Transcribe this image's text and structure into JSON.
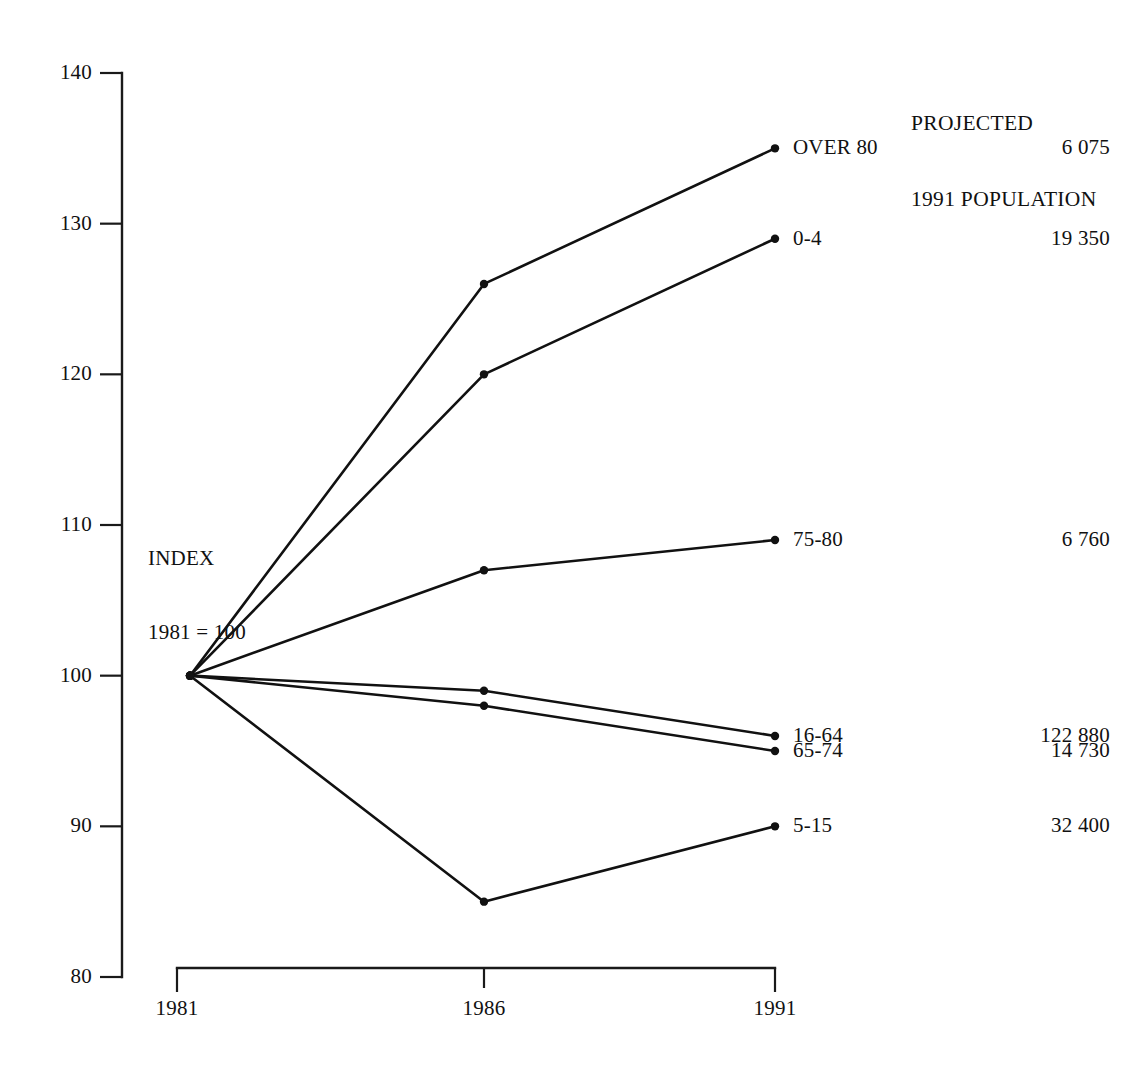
{
  "chart_data": {
    "type": "line",
    "title": "",
    "xlabel": "",
    "ylabel": "",
    "x": [
      1981,
      1986,
      1991
    ],
    "xtick_labels": [
      "1981",
      "1986",
      "1991"
    ],
    "ytick_labels": [
      "140",
      "130",
      "120",
      "110",
      "100",
      "90",
      "80"
    ],
    "yticks": [
      140,
      130,
      120,
      110,
      100,
      90,
      80
    ],
    "ylim": [
      80,
      140
    ],
    "grid": false,
    "legend_position": "right-of-endpoints",
    "annotations": {
      "index_note_line1": "INDEX",
      "index_note_line2": "1981 = 100",
      "column_header_line1": "PROJECTED",
      "column_header_line2": "1991 POPULATION"
    },
    "series": [
      {
        "name": "OVER 80",
        "values": [
          100,
          126,
          135
        ],
        "projected_1991_population": "6 075"
      },
      {
        "name": "0-4",
        "values": [
          100,
          120,
          129
        ],
        "projected_1991_population": "19 350"
      },
      {
        "name": "75-80",
        "values": [
          100,
          107,
          109
        ],
        "projected_1991_population": "6 760"
      },
      {
        "name": "16-64",
        "values": [
          100,
          99,
          96
        ],
        "projected_1991_population": "122 880"
      },
      {
        "name": "65-74",
        "values": [
          100,
          98,
          95
        ],
        "projected_1991_population": "14 730"
      },
      {
        "name": "5-15",
        "values": [
          100,
          85,
          90
        ],
        "projected_1991_population": "32 400"
      }
    ],
    "colors": {
      "ink": "#111111",
      "background": "#ffffff"
    }
  }
}
